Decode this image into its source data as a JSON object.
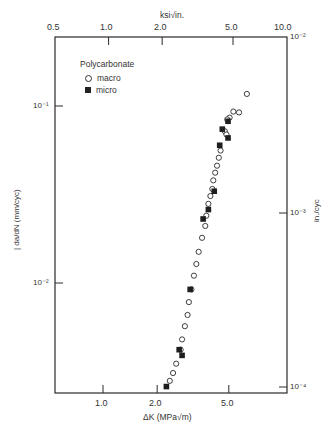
{
  "chart_data": {
    "type": "scatter",
    "title": "Polycarbonate",
    "xlabel": "ΔK (MPa√m)",
    "xlabel_top": "ksi√in.",
    "ylabel": "da/dN (mm/cyc)",
    "ylabel_right": "in./cyc",
    "xscale": "log",
    "yscale": "log",
    "xlim": [
      0.55,
      11.0
    ],
    "ylim": [
      0.0023,
      0.255
    ],
    "x_ticks_bottom": [
      "1.0",
      "2.0",
      "5.0"
    ],
    "x_ticks_top": [
      "0.5",
      "1.0",
      "2.0",
      "5.0",
      "10.0"
    ],
    "y_ticks_left": [
      "10⁻¹",
      "10⁻²"
    ],
    "y_ticks_right": [
      "10⁻²",
      "10⁻³",
      "10⁻⁴"
    ],
    "grid": false,
    "legend_position": "upper-left",
    "series": [
      {
        "name": "macro",
        "marker": "open-circle",
        "points": [
          [
            6.3,
            0.117
          ],
          [
            5.7,
            0.092
          ],
          [
            5.3,
            0.093
          ],
          [
            5.05,
            0.086
          ],
          [
            4.9,
            0.084
          ],
          [
            4.75,
            0.072
          ],
          [
            4.85,
            0.069
          ],
          [
            4.5,
            0.056
          ],
          [
            4.4,
            0.051
          ],
          [
            4.3,
            0.046
          ],
          [
            4.2,
            0.042
          ],
          [
            4.1,
            0.038
          ],
          [
            4.05,
            0.034
          ],
          [
            3.95,
            0.031
          ],
          [
            3.85,
            0.028
          ],
          [
            3.75,
            0.024
          ],
          [
            3.7,
            0.021
          ],
          [
            3.55,
            0.018
          ],
          [
            3.4,
            0.015
          ],
          [
            3.3,
            0.0128
          ],
          [
            3.2,
            0.011
          ],
          [
            3.1,
            0.0092
          ],
          [
            3.0,
            0.0078
          ],
          [
            2.95,
            0.0066
          ],
          [
            2.85,
            0.0057
          ],
          [
            2.75,
            0.0048
          ],
          [
            2.7,
            0.0042
          ],
          [
            2.55,
            0.0035
          ],
          [
            2.45,
            0.0031
          ],
          [
            2.35,
            0.0028
          ]
        ]
      },
      {
        "name": "micro",
        "marker": "filled-square",
        "points": [
          [
            4.95,
            0.082
          ],
          [
            4.6,
            0.074
          ],
          [
            4.45,
            0.06
          ],
          [
            4.95,
            0.066
          ],
          [
            4.15,
            0.033
          ],
          [
            3.85,
            0.026
          ],
          [
            3.6,
            0.023
          ],
          [
            3.05,
            0.0092
          ],
          [
            2.65,
            0.0042
          ],
          [
            2.75,
            0.0039
          ],
          [
            2.25,
            0.0026
          ]
        ]
      }
    ]
  },
  "labels": {
    "legend_title": "Polycarbonate",
    "legend_macro": "macro",
    "legend_micro": "micro",
    "top_axis_title": "ksi√in.",
    "bottom_axis_title": "ΔK (MPa√m)",
    "left_axis_title": "| da/dN (mm/cyc)",
    "right_axis_title": "in./cyc",
    "top_ticks": [
      "0.5",
      "1.0",
      "2.0",
      "5.0",
      "10.0"
    ],
    "bottom_ticks": [
      "1.0",
      "2.0",
      "5.0"
    ],
    "left_ticks": [
      "10⁻¹",
      "10⁻²"
    ],
    "right_ticks": [
      "10⁻²",
      "10⁻³",
      "10⁻⁴"
    ]
  },
  "colors": {
    "ink": "#2a2a2a",
    "background": "#ffffff"
  }
}
